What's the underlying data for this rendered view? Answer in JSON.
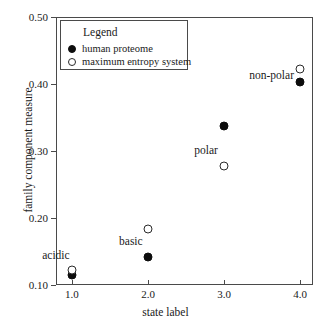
{
  "chart_data": {
    "type": "scatter",
    "title": "",
    "xlabel": "state label",
    "ylabel": "family component measure",
    "xlim": [
      0.79,
      4.17
    ],
    "ylim": [
      0.1,
      0.5
    ],
    "xticks": [
      "1.0",
      "2.0",
      "3.0",
      "4.0"
    ],
    "xtick_values": [
      1.0,
      2.0,
      3.0,
      4.0
    ],
    "yticks": [
      "0.10",
      "0.20",
      "0.30",
      "0.40",
      "0.50"
    ],
    "ytick_values": [
      0.1,
      0.2,
      0.3,
      0.4,
      0.5
    ],
    "grid": false,
    "legend_position": "upper-left",
    "x": [
      1.0,
      2.0,
      3.0,
      4.0
    ],
    "series": [
      {
        "name": "human proteome",
        "marker": "filled-circle",
        "color": "#0d0d0d",
        "values": [
          0.115,
          0.142,
          0.338,
          0.403
        ]
      },
      {
        "name": "maximum entropy system",
        "marker": "open-circle",
        "color": "#2a2a2a",
        "values": [
          0.122,
          0.183,
          0.277,
          0.422
        ]
      }
    ],
    "annotations": [
      {
        "text": "acidic",
        "x": 0.97,
        "y": 0.145
      },
      {
        "text": "basic",
        "x": 1.93,
        "y": 0.165
      },
      {
        "text": "polar",
        "x": 2.92,
        "y": 0.302
      },
      {
        "text": "non-polar",
        "x": 3.92,
        "y": 0.413
      }
    ]
  },
  "legend": {
    "title": "Legend",
    "entries": [
      {
        "label": "human proteome"
      },
      {
        "label": "maximum entropy system"
      }
    ]
  }
}
